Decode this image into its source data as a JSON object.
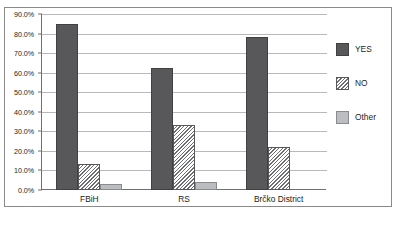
{
  "chart_data": {
    "type": "bar",
    "title": "",
    "subtitle": "",
    "xlabel": "",
    "ylabel": "",
    "categories": [
      "FBiH",
      "RS",
      "Brčko District"
    ],
    "series": [
      {
        "name": "YES",
        "values": [
          85.0,
          62.5,
          78.0
        ],
        "color": "#58585a",
        "fill": "solid"
      },
      {
        "name": "NO",
        "values": [
          13.5,
          33.0,
          22.0
        ],
        "color": "#ffffff",
        "fill": "diagonal-hatch"
      },
      {
        "name": "Other",
        "values": [
          3.0,
          4.0,
          0.0
        ],
        "color": "#bcbdc0",
        "fill": "solid"
      }
    ],
    "ylim": [
      0.0,
      90.0
    ],
    "ytick_values": [
      0.0,
      10.0,
      20.0,
      30.0,
      40.0,
      50.0,
      60.0,
      70.0,
      80.0,
      90.0
    ],
    "ytick_labels": [
      "0.0%",
      "10.0%",
      "20.0%",
      "30.0%",
      "40.0%",
      "50.0%",
      "60.0%",
      "70.0%",
      "80.0%",
      "90.0%"
    ],
    "grid": true,
    "grid_axis": "y",
    "legend_position": "right",
    "legend": [
      "YES",
      "NO",
      "Other"
    ],
    "value_format": "percent"
  },
  "colors": {
    "yes": "#58585a",
    "no": "#ffffff",
    "other": "#bcbdc0",
    "gridline": "#b9b9b9",
    "axis": "#6f6f6f",
    "frame": "#8a8a8a",
    "text": "#231f20"
  }
}
